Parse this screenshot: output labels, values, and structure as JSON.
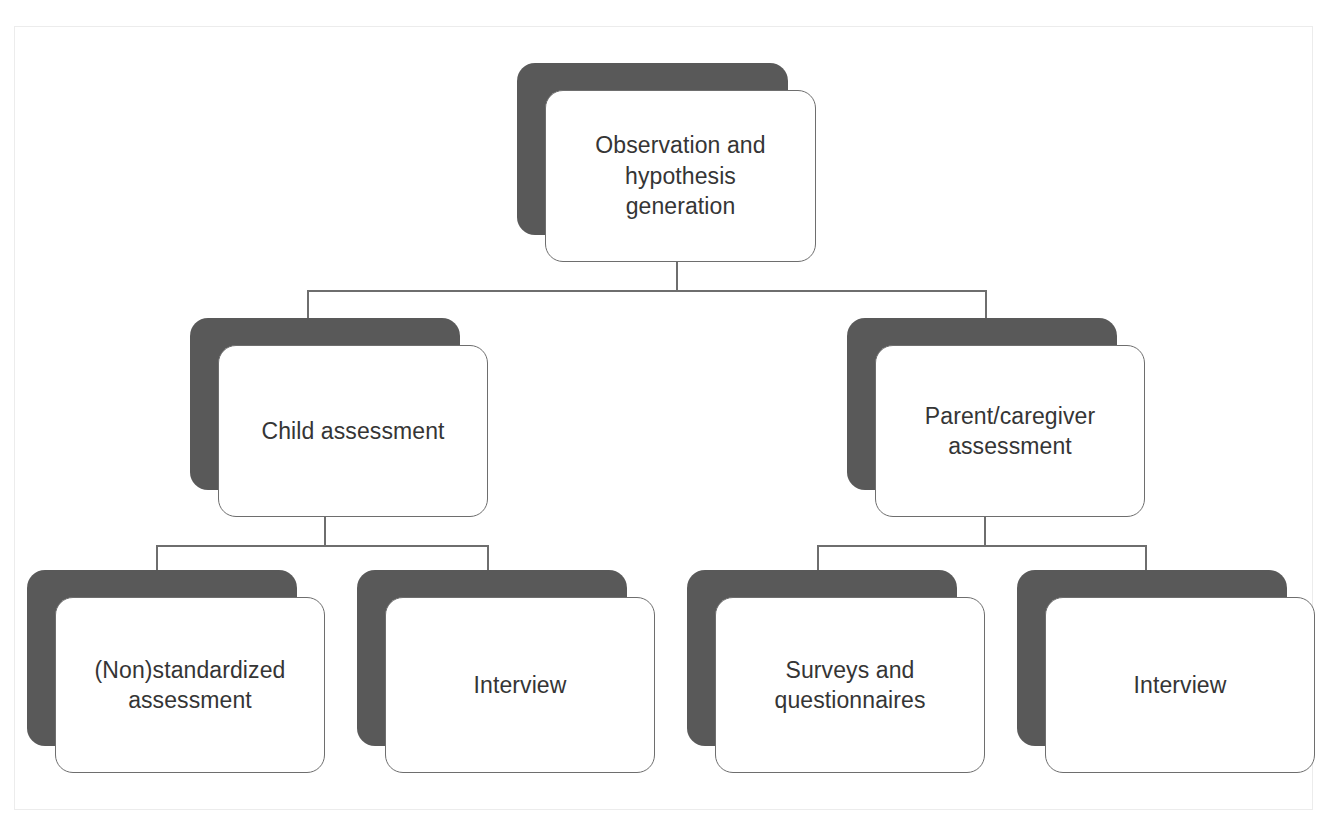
{
  "diagram": {
    "type": "hierarchy-flowchart",
    "title": "",
    "node_style": {
      "card_fill": "#ffffff",
      "card_border": "#6e6e6e",
      "shadow_fill": "#595959",
      "text_color": "#353535",
      "frame_border": "#ececec"
    },
    "levels": [
      {
        "level": 1,
        "nodes": [
          {
            "id": "root",
            "label": "Observation and\nhypothesis\ngeneration"
          }
        ]
      },
      {
        "level": 2,
        "nodes": [
          {
            "id": "child",
            "label": "Child assessment"
          },
          {
            "id": "parent",
            "label": "Parent/caregiver\nassessment"
          }
        ]
      },
      {
        "level": 3,
        "nodes": [
          {
            "id": "nonstd",
            "label": "(Non)standardized\nassessment"
          },
          {
            "id": "child-interview",
            "label": "Interview"
          },
          {
            "id": "surveys",
            "label": "Surveys and\nquestionnaires"
          },
          {
            "id": "parent-interview",
            "label": "Interview"
          }
        ]
      }
    ],
    "edges": [
      {
        "from": "root",
        "to": "child"
      },
      {
        "from": "root",
        "to": "parent"
      },
      {
        "from": "child",
        "to": "nonstd"
      },
      {
        "from": "child",
        "to": "child-interview"
      },
      {
        "from": "parent",
        "to": "surveys"
      },
      {
        "from": "parent",
        "to": "parent-interview"
      }
    ]
  }
}
